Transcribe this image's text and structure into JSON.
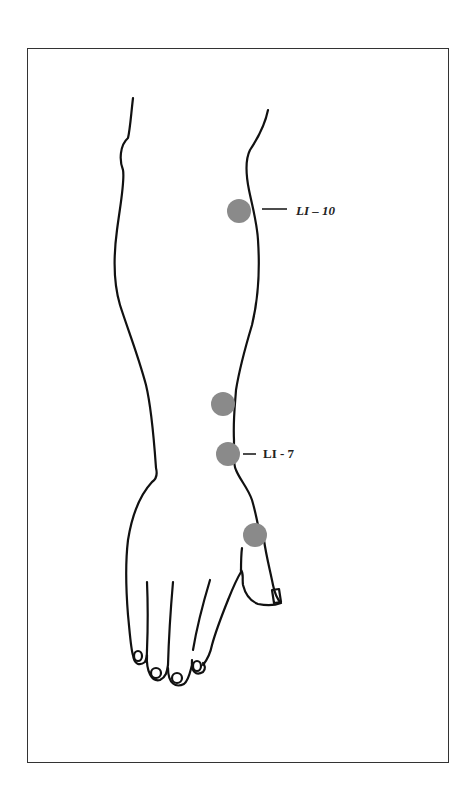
{
  "diagram": {
    "colors": {
      "outline": "#111111",
      "point": "#8a8a8a",
      "frame": "#333333",
      "background": "#ffffff"
    },
    "points": [
      {
        "id": "li-10",
        "label": "LI – 10",
        "cx": 239,
        "cy": 211,
        "r": 12,
        "labeled": true
      },
      {
        "id": "upper-wrist",
        "label": "",
        "cx": 223,
        "cy": 404,
        "r": 12,
        "labeled": false
      },
      {
        "id": "li-7",
        "label": "LI - 7",
        "cx": 228,
        "cy": 454,
        "r": 12,
        "labeled": true
      },
      {
        "id": "thumb-base",
        "label": "",
        "cx": 255,
        "cy": 535,
        "r": 12,
        "labeled": false
      }
    ]
  }
}
